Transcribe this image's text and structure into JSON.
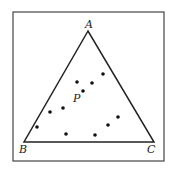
{
  "diagram": {
    "frame": {
      "x": 13,
      "y": 12,
      "w": 151,
      "h": 149
    },
    "vertices": [
      {
        "label": "A",
        "x": 88,
        "y": 31,
        "lx": 85,
        "ly": 28
      },
      {
        "label": "B",
        "x": 24,
        "y": 142,
        "lx": 19,
        "ly": 153
      },
      {
        "label": "C",
        "x": 154,
        "y": 142,
        "lx": 147,
        "ly": 153
      }
    ],
    "points": [
      {
        "x": 103,
        "y": 74
      },
      {
        "x": 77,
        "y": 82
      },
      {
        "x": 92,
        "y": 83
      },
      {
        "x": 83,
        "y": 91
      },
      {
        "x": 63,
        "y": 108
      },
      {
        "x": 50,
        "y": 112
      },
      {
        "x": 37,
        "y": 127
      },
      {
        "x": 66,
        "y": 134
      },
      {
        "x": 95,
        "y": 135
      },
      {
        "x": 108,
        "y": 125
      },
      {
        "x": 118,
        "y": 117
      }
    ],
    "point_label": {
      "text": "P",
      "x": 73,
      "y": 102
    }
  }
}
